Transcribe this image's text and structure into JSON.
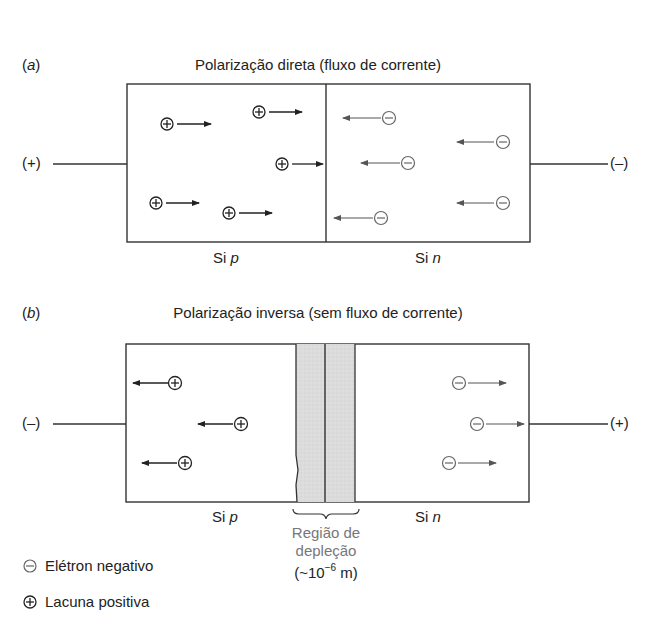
{
  "panel_a": {
    "label": "(a)",
    "label_letter": "a",
    "title": "Polarização direta (fluxo de corrente)",
    "left_terminal": "(+)",
    "right_terminal": "(–)",
    "left_region_label_prefix": "Si ",
    "left_region_label_type": "p",
    "right_region_label_prefix": "Si ",
    "right_region_label_type": "n",
    "holes_direction": "right",
    "electrons_direction": "left",
    "hole_count": 5,
    "electron_count": 5
  },
  "panel_b": {
    "label": "(b)",
    "label_letter": "b",
    "title": "Polarização inversa (sem fluxo de corrente)",
    "left_terminal": "(–)",
    "right_terminal": "(+)",
    "left_region_label_prefix": "Si ",
    "left_region_label_type": "p",
    "right_region_label_prefix": "Si ",
    "right_region_label_type": "n",
    "holes_direction": "left",
    "electrons_direction": "right",
    "hole_count": 3,
    "electron_count": 3,
    "depletion": {
      "line1": "Região de",
      "line2": "depleção",
      "line3_prefix": "(~10",
      "line3_exponent": "−6",
      "line3_suffix": " m)"
    }
  },
  "legend": [
    {
      "symbol": "⊖",
      "icon": "electron-icon",
      "label": "Elétron negativo"
    },
    {
      "symbol": "⊕",
      "icon": "hole-icon",
      "label": "Lacuna positiva"
    }
  ],
  "colors": {
    "ink": "#222222",
    "electron_gray": "#666666",
    "depletion_fill": "#d9d9d9"
  }
}
